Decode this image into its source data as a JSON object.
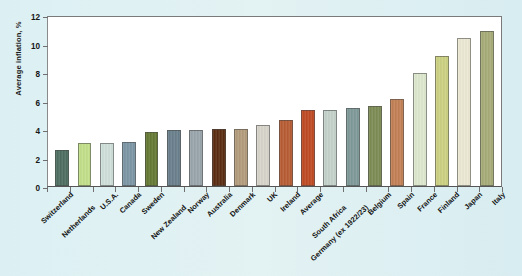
{
  "chart_data": {
    "type": "bar",
    "title": "",
    "xlabel": "",
    "ylabel": "Average inflation, %",
    "ylim": [
      0,
      12
    ],
    "yticks": [
      0,
      2,
      4,
      6,
      8,
      10,
      12
    ],
    "ytick_labels": [
      "0",
      "2",
      "4",
      "6",
      "8",
      "10",
      "12"
    ],
    "grid": false,
    "legend": "none",
    "categories": [
      "Switzerland",
      "Netherlands",
      "U.S.A.",
      "Canada",
      "Sweden",
      "New Zealand",
      "Norway",
      "Australia",
      "Denmark",
      "UK",
      "Ireland",
      "Average",
      "South Africa",
      "Germany (ex 1922/23)",
      "Belgium",
      "Spain",
      "France",
      "Finland",
      "Japan",
      "Italy"
    ],
    "values": [
      2.5,
      3.0,
      3.0,
      3.1,
      3.8,
      3.9,
      3.9,
      4.0,
      4.0,
      4.3,
      4.6,
      5.3,
      5.3,
      5.5,
      5.6,
      6.1,
      7.9,
      9.1,
      10.4,
      10.9
    ],
    "bar_colors": [
      "#4e6f62",
      "#c2e08a",
      "#cfe0da",
      "#7d96a6",
      "#667a33",
      "#69808c",
      "#9aa6ac",
      "#5a2c11",
      "#b39c7c",
      "#d7d5cb",
      "#b75c33",
      "#bf4a23",
      "#c3d2cb",
      "#7f9a99",
      "#7d8c55",
      "#c28055",
      "#dde8cf",
      "#ccd182",
      "#ece9d4",
      "#a7ac78"
    ]
  },
  "axes": {
    "plot_background": "#ffffff",
    "figure_background": "#ddeff2",
    "frame_color": "#6f6f6f"
  }
}
